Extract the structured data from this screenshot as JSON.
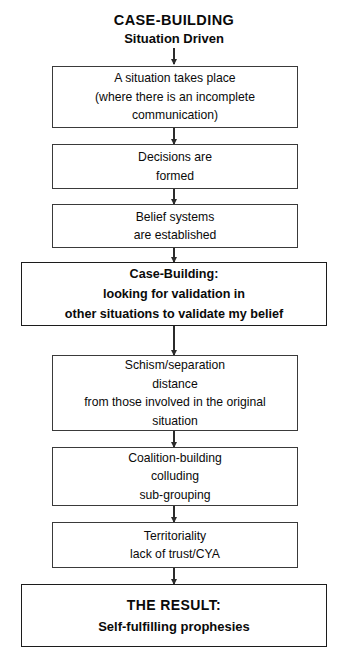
{
  "diagram": {
    "title": {
      "main": "CASE-BUILDING",
      "sub": "Situation Driven"
    },
    "nodes": [
      {
        "id": "situation",
        "emphasis": "normal",
        "lines": [
          "A situation takes place",
          "(where there is an incomplete",
          "communication)"
        ]
      },
      {
        "id": "decisions",
        "emphasis": "normal",
        "lines": [
          "Decisions are",
          "formed"
        ]
      },
      {
        "id": "belief-systems",
        "emphasis": "normal",
        "lines": [
          "Belief systems",
          "are established"
        ]
      },
      {
        "id": "case-building",
        "emphasis": "bold",
        "lines": [
          "Case-Building:",
          "looking for validation in",
          "other situations to validate my belief"
        ]
      },
      {
        "id": "schism",
        "emphasis": "normal",
        "lines": [
          "Schism/separation",
          "distance",
          "from those involved in the original",
          "situation"
        ]
      },
      {
        "id": "coalition",
        "emphasis": "normal",
        "lines": [
          "Coalition-building",
          "colluding",
          "sub-grouping"
        ]
      },
      {
        "id": "territoriality",
        "emphasis": "normal",
        "lines": [
          "Territoriality",
          "lack of trust/CYA"
        ]
      },
      {
        "id": "result",
        "emphasis": "result",
        "lines": [
          "THE RESULT:",
          "Self-fulfilling prophesies"
        ]
      }
    ],
    "connectors": [
      {
        "from": "title",
        "to": "situation"
      },
      {
        "from": "situation",
        "to": "decisions"
      },
      {
        "from": "decisions",
        "to": "belief-systems"
      },
      {
        "from": "belief-systems",
        "to": "case-building"
      },
      {
        "from": "case-building",
        "to": "schism"
      },
      {
        "from": "schism",
        "to": "coalition"
      },
      {
        "from": "coalition",
        "to": "territoriality"
      },
      {
        "from": "territoriality",
        "to": "result"
      }
    ],
    "colors": {
      "background": "#ffffff",
      "text": "#0a0a0a",
      "border": "#3a3a3a",
      "border_emphasis": "#1c1c1c",
      "connector": "#2b2b2b"
    }
  }
}
